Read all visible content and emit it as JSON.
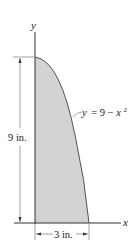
{
  "figure": {
    "axes": {
      "x_label": "x",
      "y_label": "y"
    },
    "curve": {
      "equation_lhs": "y",
      "equation_eq": "= 9 − ",
      "equation_var": "x",
      "equation_exp": "2"
    },
    "dimensions": {
      "height_label": "9 in.",
      "width_label": "3 in."
    },
    "colors": {
      "fill": "#d3d3d3",
      "line": "#333333"
    }
  }
}
